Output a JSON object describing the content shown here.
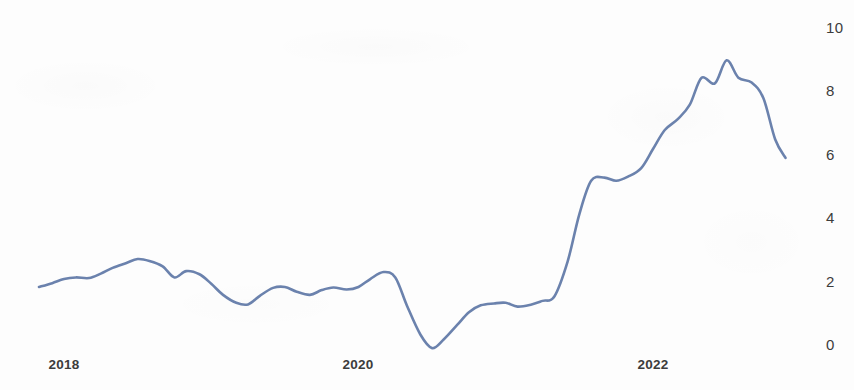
{
  "chart_data": {
    "type": "line",
    "title": "",
    "subtitle": "",
    "xlabel": "",
    "ylabel": "",
    "grid": false,
    "legend": "none",
    "series_name": "Inflation Rate",
    "line_color": "#6b82ad",
    "background_color": "#fdfdfd",
    "xlim": [
      2017.82,
      2022.92
    ],
    "ylim": [
      -0.6,
      10.3
    ],
    "x_tick_labels": [
      "2018",
      "2020",
      "2022"
    ],
    "x_tick_values": [
      2018,
      2020,
      2022
    ],
    "y_tick_labels": [
      "0",
      "2",
      "4",
      "6",
      "8",
      "10"
    ],
    "y_tick_values": [
      0,
      2,
      4,
      6,
      8,
      10
    ],
    "x": [
      2017.83,
      2017.92,
      2018.0,
      2018.08,
      2018.17,
      2018.25,
      2018.33,
      2018.42,
      2018.5,
      2018.58,
      2018.67,
      2018.75,
      2018.83,
      2018.92,
      2019.0,
      2019.08,
      2019.17,
      2019.25,
      2019.33,
      2019.42,
      2019.5,
      2019.58,
      2019.67,
      2019.75,
      2019.83,
      2019.92,
      2020.0,
      2020.08,
      2020.17,
      2020.25,
      2020.33,
      2020.42,
      2020.5,
      2020.58,
      2020.67,
      2020.75,
      2020.83,
      2020.92,
      2021.0,
      2021.08,
      2021.17,
      2021.25,
      2021.33,
      2021.42,
      2021.5,
      2021.58,
      2021.67,
      2021.75,
      2021.83,
      2021.92,
      2022.0,
      2022.08,
      2022.17,
      2022.25,
      2022.33,
      2022.42,
      2022.5,
      2022.58,
      2022.67,
      2022.75,
      2022.83,
      2022.9
    ],
    "values": [
      1.8,
      1.92,
      2.05,
      2.1,
      2.08,
      2.22,
      2.4,
      2.55,
      2.68,
      2.62,
      2.45,
      2.1,
      2.3,
      2.2,
      1.9,
      1.55,
      1.3,
      1.25,
      1.52,
      1.77,
      1.8,
      1.65,
      1.55,
      1.7,
      1.78,
      1.72,
      1.8,
      2.05,
      2.27,
      2.1,
      1.2,
      0.3,
      -0.13,
      0.15,
      0.6,
      1.0,
      1.22,
      1.28,
      1.3,
      1.18,
      1.24,
      1.36,
      1.5,
      2.6,
      4.1,
      5.15,
      5.25,
      5.15,
      5.28,
      5.55,
      6.15,
      6.75,
      7.1,
      7.55,
      8.4,
      8.22,
      8.95,
      8.4,
      8.25,
      7.75,
      6.45,
      5.87
    ]
  },
  "axis": {
    "y_ticks": [
      {
        "label": "10",
        "top": 19
      },
      {
        "label": "8",
        "top": 82
      },
      {
        "label": "6",
        "top": 146
      },
      {
        "label": "4",
        "top": 209
      },
      {
        "label": "2",
        "top": 273
      },
      {
        "label": "0",
        "top": 336
      }
    ],
    "x_ticks": [
      {
        "label": "2018",
        "left": 64
      },
      {
        "label": "2020",
        "left": 358
      },
      {
        "label": "2022",
        "left": 653
      }
    ]
  }
}
